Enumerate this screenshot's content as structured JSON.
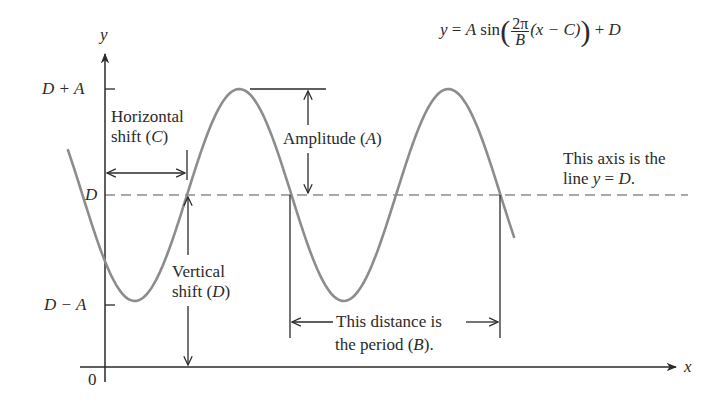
{
  "diagram": {
    "equation": {
      "lhs": "y",
      "eq": "=",
      "amp": "A",
      "fn": "sin",
      "frac_num": "2π",
      "frac_den": "B",
      "inner": "(x − C)",
      "tail_op": "+",
      "tail": "D"
    },
    "axes": {
      "y_label": "y",
      "x_label": "x",
      "origin_label": "0"
    },
    "y_ticks": {
      "top": "D + A",
      "mid": "D",
      "bottom": "D − A"
    },
    "annotations": {
      "horizontal_shift_line1": "Horizontal",
      "horizontal_shift_line2_pre": "shift (",
      "horizontal_shift_var": "C",
      "horizontal_shift_line2_post": ")",
      "amplitude_pre": "Amplitude (",
      "amplitude_var": "A",
      "amplitude_post": ")",
      "vertical_shift_line1": "Vertical",
      "vertical_shift_line2_pre": "shift (",
      "vertical_shift_var": "D",
      "vertical_shift_line2_post": ")",
      "axis_note_line1": "This axis is the",
      "axis_note_line2_pre": "line ",
      "axis_note_line2_y": "y",
      "axis_note_line2_eq": " = ",
      "axis_note_line2_D": "D",
      "axis_note_line2_post": ".",
      "period_line1": "This distance is",
      "period_line2_pre": "the period (",
      "period_var": "B",
      "period_line2_post": ")."
    },
    "colors": {
      "curve": "#8c8c8c",
      "ink": "#2a2a2a",
      "dashed_axis": "#8c8c8c"
    }
  }
}
